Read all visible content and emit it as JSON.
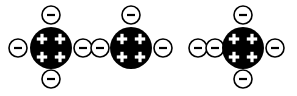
{
  "canvas": {
    "width": 297,
    "height": 96,
    "background": "#ffffff"
  },
  "style": {
    "nucleus_fill": "#000000",
    "charge_symbol_color": "#ffffff",
    "electron_fill": "#ffffff",
    "electron_stroke": "#000000",
    "electron_symbol_color": "#000000",
    "nucleus_radius": 21,
    "electron_radius": 9,
    "electron_stroke_width": 1.6,
    "plus_arm": 5.2,
    "plus_thickness": 3.2,
    "minus_length": 8,
    "minus_thickness": 2.2
  },
  "diagram": {
    "type": "atomic-charge-diagram",
    "atom_count": 3,
    "atoms": [
      {
        "id": "atom-1",
        "label": "neutral-atom",
        "nucleus": {
          "cx": 51,
          "cy": 48,
          "charge_symbol": "+",
          "charge_count": 4
        },
        "proton_positions": [
          {
            "dx": -9,
            "dy": -9
          },
          {
            "dx": 9,
            "dy": -9
          },
          {
            "dx": -9,
            "dy": 9
          },
          {
            "dx": 9,
            "dy": 9
          }
        ],
        "electron_symbol": "−",
        "electron_count": 4,
        "electrons": [
          {
            "id": "atom-1-electron-top",
            "cx": 51,
            "cy": 15
          },
          {
            "id": "atom-1-electron-bottom",
            "cx": 51,
            "cy": 79
          },
          {
            "id": "atom-1-electron-left",
            "cx": 18,
            "cy": 48
          },
          {
            "id": "atom-1-electron-right",
            "cx": 83,
            "cy": 48
          }
        ]
      },
      {
        "id": "atom-2",
        "label": "positive-ion",
        "nucleus": {
          "cx": 131,
          "cy": 48,
          "charge_symbol": "+",
          "charge_count": 4
        },
        "proton_positions": [
          {
            "dx": -9,
            "dy": -9
          },
          {
            "dx": 9,
            "dy": -9
          },
          {
            "dx": -9,
            "dy": 9
          },
          {
            "dx": 9,
            "dy": 9
          }
        ],
        "electron_symbol": "−",
        "electron_count": 3,
        "electrons": [
          {
            "id": "atom-2-electron-top",
            "cx": 131,
            "cy": 15
          },
          {
            "id": "atom-2-electron-left",
            "cx": 100,
            "cy": 48
          },
          {
            "id": "atom-2-electron-right",
            "cx": 163,
            "cy": 48
          }
        ]
      },
      {
        "id": "atom-3",
        "label": "negative-ion",
        "nucleus": {
          "cx": 243,
          "cy": 48,
          "charge_symbol": "+",
          "charge_count": 4
        },
        "proton_positions": [
          {
            "dx": -9,
            "dy": -9
          },
          {
            "dx": 9,
            "dy": -9
          },
          {
            "dx": -9,
            "dy": 9
          },
          {
            "dx": 9,
            "dy": 9
          }
        ],
        "electron_symbol": "−",
        "electron_count": 5,
        "electrons": [
          {
            "id": "atom-3-electron-top",
            "cx": 243,
            "cy": 15
          },
          {
            "id": "atom-3-electron-bottom",
            "cx": 243,
            "cy": 79
          },
          {
            "id": "atom-3-electron-left-outer",
            "cx": 198,
            "cy": 48
          },
          {
            "id": "atom-3-electron-left-inner",
            "cx": 215,
            "cy": 48
          },
          {
            "id": "atom-3-electron-right",
            "cx": 275,
            "cy": 48
          }
        ]
      }
    ]
  }
}
